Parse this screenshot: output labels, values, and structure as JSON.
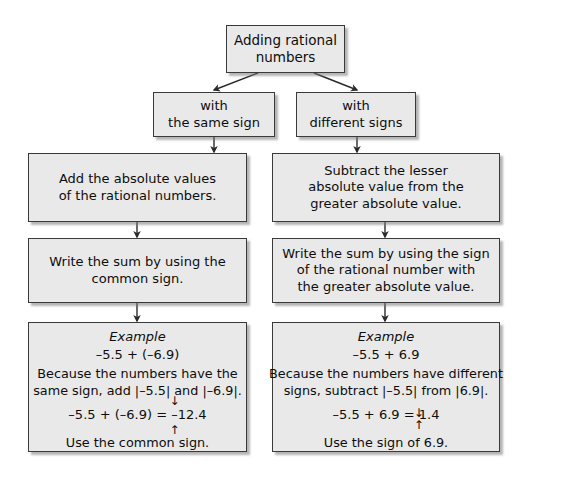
{
  "diagram": {
    "title": "Adding rational numbers",
    "colors": {
      "node_fill": "#e9e9e9",
      "node_border": "#3a3a3a",
      "text": "#0d0d0d",
      "background": "#ffffff",
      "connector": "#2b2b2b"
    },
    "root": {
      "line1": "Adding rational",
      "line2": "numbers"
    },
    "branches": {
      "left": {
        "label_line1": "with",
        "label_line2": "the same sign",
        "step1_line1": "Add the absolute values",
        "step1_line2": "of the rational numbers.",
        "step2_line1": "Write the sum by using the",
        "step2_line2": "common sign.",
        "example": {
          "heading": "Example",
          "expression": "–5.5 + (–6.9)",
          "body_line1": "Because the numbers have the",
          "body_line2": "same sign, add |–5.5| and |–6.9|.",
          "result_prefix": "–5.5 + (–6.9) = ",
          "result_sign": "–",
          "result_value": "12.4",
          "arrow_down": "↓",
          "arrow_up": "↑",
          "footnote": "Use the common sign."
        }
      },
      "right": {
        "label_line1": "with",
        "label_line2": "different signs",
        "step1_line1": "Subtract the lesser",
        "step1_line2": "absolute value from the",
        "step1_line3": "greater absolute value.",
        "step2_line1": "Write the sum by using the sign",
        "step2_line2": "of the rational number with",
        "step2_line3": "the greater absolute value.",
        "example": {
          "heading": "Example",
          "expression": "–5.5 + 6.9",
          "body_line1": "Because the numbers have different",
          "body_line2": "signs, subtract |–5.5| from |6.9|.",
          "result_prefix": "–5.5 + 6.9 = ",
          "result_sign": "",
          "result_value": "1.4",
          "arrow_down": "↓",
          "arrow_up": "↑",
          "footnote": "Use the sign of 6.9."
        }
      }
    }
  }
}
